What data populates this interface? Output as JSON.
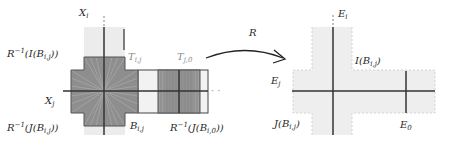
{
  "diagram": {
    "left": {
      "axes": {
        "vertical": "X_i",
        "horizontal": "X_j"
      },
      "labels": {
        "x_i": {
          "main": "X",
          "sub": "i"
        },
        "x_j": {
          "main": "X",
          "sub": "j"
        },
        "r_inv_i_top": {
          "prefix": "R",
          "sup": "−1",
          "body": "(I(B",
          "sub": "i,j",
          "suffix": "))"
        },
        "r_inv_j_bottom": {
          "prefix": "R",
          "sup": "−1",
          "body": "(J(B",
          "sub": "i,j",
          "suffix": "))"
        },
        "t_ij": {
          "main": "T",
          "sub": "i,j"
        },
        "t_j0": {
          "main": "T",
          "sub": "j,0"
        },
        "b_ij": {
          "main": "B",
          "sub": "i,j"
        },
        "r_inv_j_b_i0": {
          "prefix": "R",
          "sup": "−1",
          "body": "(J(B",
          "sub": "i,0",
          "suffix": "))"
        },
        "continuation": "· ·",
        "top_dots": "⋮"
      }
    },
    "arrow": {
      "label": "R"
    },
    "right": {
      "axes": {
        "vertical": "E_i",
        "horizontal": "E_j"
      },
      "labels": {
        "e_i": {
          "main": "E",
          "sub": "i"
        },
        "e_j": {
          "main": "E",
          "sub": "j"
        },
        "e_0": {
          "main": "E",
          "sub": "0"
        },
        "i_b_ij": {
          "body": "I(B",
          "sub": "i,j",
          "suffix": ")"
        },
        "j_b_ij": {
          "body": "J(B",
          "sub": "i,j",
          "suffix": ")"
        },
        "top_dots": "⋮"
      }
    },
    "colors": {
      "light_band": "#ececec",
      "dark_region": "#8e8e8e",
      "hatch": "#a8a8a8",
      "axis": "#333333",
      "outline": "#555555",
      "dashed": "#c8c8c8"
    }
  }
}
